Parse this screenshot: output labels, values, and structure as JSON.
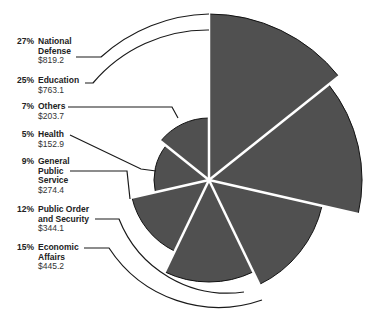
{
  "chart_data": {
    "type": "polar-area",
    "title": "",
    "center": [
      209,
      180
    ],
    "start_angle_deg": 0,
    "direction": "clockwise",
    "wedge_color": "#505050",
    "separator_color": "#ffffff",
    "categories": [
      "National Defense",
      "Education",
      "Economic Affairs",
      "Public Order and Security",
      "General Public Service",
      "Health",
      "Others"
    ],
    "values": [
      819.2,
      763.1,
      445.2,
      344.1,
      274.4,
      152.9,
      203.7
    ],
    "percents": [
      27,
      25,
      15,
      12,
      9,
      5,
      7
    ],
    "radii_px": [
      166,
      153,
      116,
      102,
      79,
      55,
      62
    ]
  },
  "labels": [
    {
      "pct": "27%",
      "name": "National Defense",
      "lines": [
        "National",
        "Defense"
      ],
      "value": "$819.2"
    },
    {
      "pct": "25%",
      "name": "Education",
      "lines": [
        "Education"
      ],
      "value": "$763.1"
    },
    {
      "pct": "7%",
      "name": "Others",
      "lines": [
        "Others"
      ],
      "value": "$203.7"
    },
    {
      "pct": "5%",
      "name": "Health",
      "lines": [
        "Health"
      ],
      "value": "$152.9"
    },
    {
      "pct": "9%",
      "name": "General Public Service",
      "lines": [
        "General",
        "Public",
        "Service"
      ],
      "value": "$274.4"
    },
    {
      "pct": "12%",
      "name": "Public Order and Security",
      "lines": [
        "Public Order",
        "and Security"
      ],
      "value": "$344.1"
    },
    {
      "pct": "15%",
      "name": "Economic Affairs",
      "lines": [
        "Economic",
        "Affairs"
      ],
      "value": "$445.2"
    }
  ]
}
